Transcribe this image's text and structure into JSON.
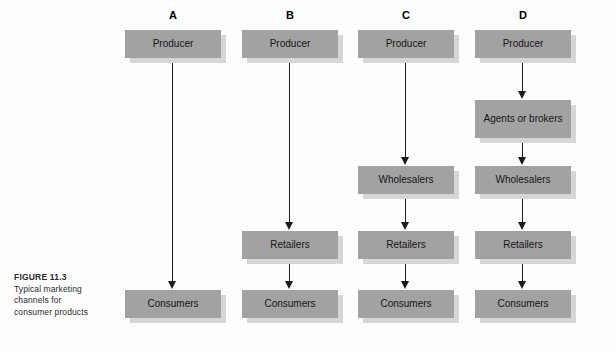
{
  "figure": {
    "label": "FIGURE 11.3",
    "caption_lines": [
      "Typical marketing",
      "channels for",
      "consumer products"
    ]
  },
  "colors": {
    "box_fill": "#a2a2a2",
    "box_shadow": "#d6d6d6",
    "arrow": "#1b1b1b",
    "background": "#fdfdfd",
    "text": "#161616"
  },
  "columns": [
    {
      "header": "A",
      "left": 113,
      "nodes": [
        {
          "label": "Producer",
          "top": 30,
          "lines": 1
        },
        {
          "label": "Consumers",
          "top": 290,
          "lines": 1
        }
      ],
      "arrows": [
        {
          "from_top": 58,
          "to_top": 290
        }
      ]
    },
    {
      "header": "B",
      "left": 230,
      "nodes": [
        {
          "label": "Producer",
          "top": 30,
          "lines": 1
        },
        {
          "label": "Retailers",
          "top": 231,
          "lines": 1
        },
        {
          "label": "Consumers",
          "top": 290,
          "lines": 1
        }
      ],
      "arrows": [
        {
          "from_top": 58,
          "to_top": 231
        },
        {
          "from_top": 259,
          "to_top": 290
        }
      ]
    },
    {
      "header": "C",
      "left": 346,
      "nodes": [
        {
          "label": "Producer",
          "top": 30,
          "lines": 1
        },
        {
          "label": "Wholesalers",
          "top": 166,
          "lines": 1
        },
        {
          "label": "Retailers",
          "top": 231,
          "lines": 1
        },
        {
          "label": "Consumers",
          "top": 290,
          "lines": 1
        }
      ],
      "arrows": [
        {
          "from_top": 58,
          "to_top": 166
        },
        {
          "from_top": 194,
          "to_top": 231
        },
        {
          "from_top": 259,
          "to_top": 290
        }
      ]
    },
    {
      "header": "D",
      "left": 463,
      "nodes": [
        {
          "label": "Producer",
          "top": 30,
          "lines": 1
        },
        {
          "label": "Agents or brokers",
          "top": 100,
          "lines": 2
        },
        {
          "label": "Wholesalers",
          "top": 166,
          "lines": 1
        },
        {
          "label": "Retailers",
          "top": 231,
          "lines": 1
        },
        {
          "label": "Consumers",
          "top": 290,
          "lines": 1
        }
      ],
      "arrows": [
        {
          "from_top": 58,
          "to_top": 100
        },
        {
          "from_top": 138,
          "to_top": 166
        },
        {
          "from_top": 194,
          "to_top": 231
        },
        {
          "from_top": 259,
          "to_top": 290
        }
      ]
    }
  ]
}
